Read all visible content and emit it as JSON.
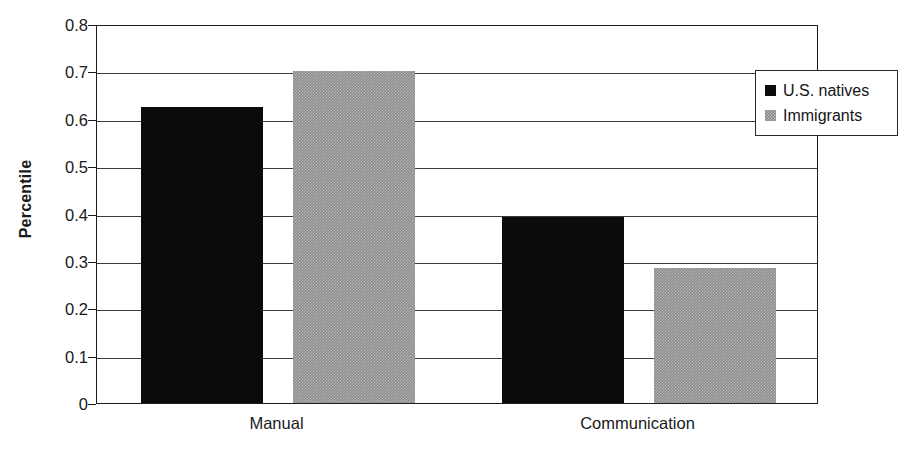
{
  "chart_data": {
    "type": "bar",
    "title": "",
    "subtitle": "",
    "xlabel": "",
    "ylabel": "Percentile",
    "categories": [
      "Manual",
      "Communication"
    ],
    "series": [
      {
        "name": "U.S. natives",
        "color": "#0b0b0b",
        "values": [
          0.625,
          0.393
        ]
      },
      {
        "name": "Immigrants",
        "color": "#8d8d8d",
        "values": [
          0.7,
          0.285
        ]
      }
    ],
    "ylim": [
      0,
      0.8
    ],
    "ytick_values": [
      0.8,
      0.7,
      0.6,
      0.5,
      0.4,
      0.3,
      0.2,
      0.1,
      0
    ],
    "ytick_labels": [
      "0.8",
      "0.7",
      "0.6",
      "0.5",
      "0.4",
      "0.3",
      "0.2",
      "0.1",
      "0"
    ],
    "grid": true,
    "grid_axis": "y",
    "legend_position": "top-right",
    "plot_background": "#ffffff",
    "frame_color": "#1d1d1d"
  }
}
